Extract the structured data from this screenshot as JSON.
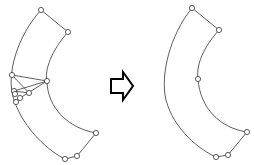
{
  "diagram": {
    "colors": {
      "stroke": "#333333",
      "background": "#ffffff"
    },
    "left_shape": {
      "outer_curve": "M41,10 C18,35 5,75 14,100 C24,130 50,152 65,159",
      "inner_curve": "M68,32 C52,50 44,70 47,82 C48,108 68,128 96,133",
      "edges": [
        [
          41,
          10,
          68,
          32
        ],
        [
          96,
          133,
          77,
          156
        ],
        [
          77,
          156,
          65,
          159
        ],
        [
          12,
          75,
          47,
          81
        ],
        [
          14,
          91,
          47,
          81
        ],
        [
          12,
          75,
          29,
          93
        ],
        [
          14,
          91,
          29,
          93
        ],
        [
          20,
          98,
          47,
          81
        ],
        [
          16,
          102,
          20,
          98
        ]
      ],
      "points": [
        [
          41,
          10
        ],
        [
          68,
          32
        ],
        [
          12,
          75
        ],
        [
          47,
          81
        ],
        [
          14,
          91
        ],
        [
          15,
          94
        ],
        [
          29,
          93
        ],
        [
          20,
          98
        ],
        [
          16,
          102
        ],
        [
          96,
          133
        ],
        [
          77,
          156
        ],
        [
          65,
          159
        ]
      ]
    },
    "arrow": {
      "icon": "right-arrow-icon",
      "x": 110,
      "y": 72,
      "width": 24,
      "height": 26
    },
    "right_shape": {
      "outer_curve": "M192,8 C170,35 160,75 166,100 C174,130 200,150 216,157",
      "inner_curve": "M219,30 C203,48 196,65 198,79 C200,108 220,128 247,132",
      "edges": [
        [
          192,
          8,
          219,
          30
        ],
        [
          247,
          132,
          228,
          155
        ],
        [
          228,
          155,
          216,
          157
        ]
      ],
      "points": [
        [
          192,
          8
        ],
        [
          219,
          30
        ],
        [
          198,
          79
        ],
        [
          247,
          132
        ],
        [
          228,
          155
        ],
        [
          216,
          157
        ]
      ]
    }
  }
}
